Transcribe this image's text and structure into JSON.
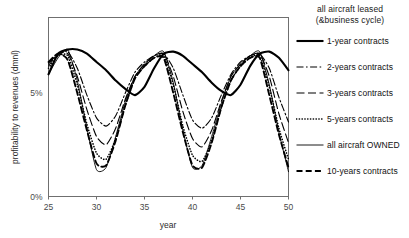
{
  "chart_data": {
    "type": "line",
    "title": "",
    "xlabel": "year",
    "ylabel": "profitability to revenues (dmnl)",
    "xlim": [
      25,
      50
    ],
    "ylim": [
      0,
      0.0865
    ],
    "xticks": [
      "25",
      "30",
      "35",
      "40",
      "45",
      "50"
    ],
    "xtick_values": [
      25,
      30,
      35,
      40,
      45,
      50
    ],
    "yticks": [
      "0%",
      "5%"
    ],
    "ytick_values": [
      0,
      5
    ],
    "grid": false,
    "legend_position": "right",
    "legend_title_lines": [
      "all aircraft leased",
      "(&business cycle)"
    ],
    "x": [
      25,
      26,
      27,
      28,
      29,
      30,
      31,
      32,
      33,
      34,
      35,
      36,
      37,
      38,
      39,
      40,
      41,
      42,
      43,
      44,
      45,
      46,
      47,
      48,
      49,
      50
    ],
    "series": [
      {
        "name": "1-year contracts",
        "style": "solid-thick",
        "values": [
          5.9,
          6.9,
          7.1,
          7.1,
          6.9,
          6.5,
          6.1,
          5.6,
          5.2,
          4.9,
          5.3,
          6.2,
          6.9,
          7.0,
          6.8,
          6.4,
          6.0,
          5.5,
          5.1,
          4.9,
          5.4,
          6.3,
          6.9,
          7.0,
          6.7,
          6.1
        ]
      },
      {
        "name": "2-years contracts",
        "style": "dash-dot",
        "values": [
          6.3,
          6.9,
          7.0,
          6.2,
          4.9,
          3.8,
          3.4,
          3.9,
          5.0,
          6.0,
          6.5,
          6.8,
          6.9,
          6.2,
          4.9,
          3.7,
          3.3,
          3.8,
          4.9,
          5.9,
          6.5,
          6.8,
          6.9,
          6.2,
          4.8,
          3.6
        ]
      },
      {
        "name": "3-years contracts",
        "style": "dash-long",
        "values": [
          6.4,
          6.9,
          6.9,
          5.8,
          4.2,
          2.9,
          2.5,
          3.3,
          4.7,
          5.8,
          6.4,
          6.8,
          6.9,
          5.8,
          4.1,
          2.8,
          2.4,
          3.2,
          4.6,
          5.8,
          6.4,
          6.8,
          6.9,
          5.8,
          4.0,
          2.6
        ]
      },
      {
        "name": "5-years contracts",
        "style": "dotted",
        "values": [
          6.2,
          6.8,
          6.8,
          5.4,
          3.5,
          2.1,
          1.8,
          2.8,
          4.4,
          5.7,
          6.3,
          6.7,
          6.8,
          5.4,
          3.4,
          2.0,
          1.7,
          2.7,
          4.3,
          5.6,
          6.3,
          6.7,
          6.8,
          5.3,
          3.3,
          1.8
        ]
      },
      {
        "name": "all aircraft OWNED",
        "style": "solid-thin",
        "values": [
          5.9,
          6.7,
          7.1,
          5.6,
          3.3,
          1.3,
          1.4,
          2.9,
          4.6,
          5.8,
          6.4,
          6.8,
          7.0,
          5.5,
          3.2,
          1.4,
          1.5,
          2.9,
          4.5,
          5.8,
          6.4,
          6.8,
          7.0,
          5.4,
          3.1,
          1.2
        ]
      },
      {
        "name": "10-years contracts",
        "style": "dash-thick",
        "values": [
          6.5,
          6.9,
          6.6,
          5.0,
          3.2,
          1.6,
          1.5,
          2.7,
          4.4,
          5.7,
          6.3,
          6.7,
          6.7,
          5.0,
          3.1,
          1.5,
          1.4,
          2.6,
          4.3,
          5.6,
          6.3,
          6.7,
          6.7,
          4.9,
          3.0,
          1.4
        ]
      }
    ]
  },
  "legend": {
    "title_line_1": "all aircraft leased",
    "title_line_2": "(&business cycle)",
    "items": [
      {
        "label": "1-year contracts"
      },
      {
        "label": "2-years contracts"
      },
      {
        "label": "3-years contracts"
      },
      {
        "label": "5-years contracts"
      },
      {
        "label": "all aircraft OWNED"
      },
      {
        "label": "10-years contracts"
      }
    ]
  },
  "axes": {
    "x_label": "year",
    "y_label": "profitability to revenues (dmnl)",
    "x_tick_0": "25",
    "x_tick_1": "30",
    "x_tick_2": "35",
    "x_tick_3": "40",
    "x_tick_4": "45",
    "x_tick_5": "50",
    "y_tick_0": "0%",
    "y_tick_1": "5%"
  },
  "colors": {
    "line": "#000000",
    "frame": "#6f6f6f",
    "text": "#1a1a1a",
    "background": "#ffffff"
  }
}
